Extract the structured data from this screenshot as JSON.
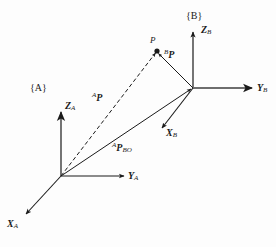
{
  "figure": {
    "background_color": "#fdfdfd",
    "stroke_color": "#1a1a1a",
    "width": 276,
    "height": 247
  },
  "frames": {
    "a": {
      "tag": "{A}",
      "origin": [
        61,
        176
      ],
      "axes": {
        "z": {
          "label": "Z",
          "sub": "A",
          "tip": [
            61,
            110
          ]
        },
        "y": {
          "label": "Y",
          "sub": "A",
          "tip": [
            126,
            176
          ]
        },
        "x": {
          "label": "X",
          "sub": "A",
          "tip": [
            24,
            216
          ]
        }
      }
    },
    "b": {
      "tag": "{B}",
      "origin": [
        193,
        88
      ],
      "axes": {
        "z": {
          "label": "Z",
          "sub": "B",
          "tip": [
            193,
            30
          ]
        },
        "y": {
          "label": "Y",
          "sub": "B",
          "tip": [
            254,
            88
          ]
        },
        "x": {
          "label": "X",
          "sub": "B",
          "tip": [
            160,
            130
          ]
        }
      }
    }
  },
  "point": {
    "label": "P",
    "position": [
      157,
      51
    ]
  },
  "vectors": [
    {
      "name": "a-p",
      "sup": "A",
      "label": "P",
      "sub": "",
      "style": "dashed",
      "from": [
        61,
        176
      ],
      "to": [
        157,
        51
      ],
      "label_pos": [
        92,
        94
      ]
    },
    {
      "name": "b-p",
      "sup": "B",
      "label": "P",
      "sub": "",
      "style": "solid",
      "from": [
        193,
        88
      ],
      "to": [
        157,
        51
      ],
      "label_pos": [
        165,
        55
      ]
    },
    {
      "name": "a-p-borg",
      "sup": "A",
      "label": "P",
      "sub": "BO",
      "style": "solid",
      "from": [
        61,
        176
      ],
      "to": [
        193,
        88
      ],
      "label_pos": [
        113,
        146
      ]
    }
  ]
}
